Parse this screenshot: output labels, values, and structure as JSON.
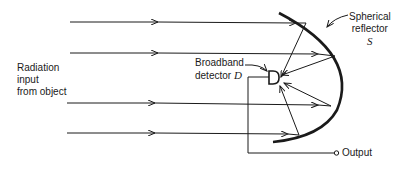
{
  "diagram": {
    "type": "optical-schematic",
    "labels": {
      "input_line1": "Radiation",
      "input_line2": "input",
      "input_line3": "from object",
      "detector_line1": "Broadband",
      "detector_line2_text": "detector ",
      "detector_symbol": "D",
      "reflector_line1": "Spherical",
      "reflector_line2": "reflector",
      "reflector_symbol": "S",
      "output": "Output"
    },
    "colors": {
      "stroke": "#1a1a1a",
      "background": "#ffffff"
    },
    "incoming_rays": [
      {
        "y": 22,
        "x_start": 70,
        "x_end": 306
      },
      {
        "y": 53,
        "x_start": 70,
        "x_end": 335
      },
      {
        "y": 103,
        "x_start": 67,
        "x_end": 331
      },
      {
        "y": 133,
        "x_start": 67,
        "x_end": 299
      }
    ],
    "elements": [
      "incoming-rays",
      "spherical-reflector",
      "reflected-rays",
      "broadband-detector",
      "output-lead"
    ]
  }
}
